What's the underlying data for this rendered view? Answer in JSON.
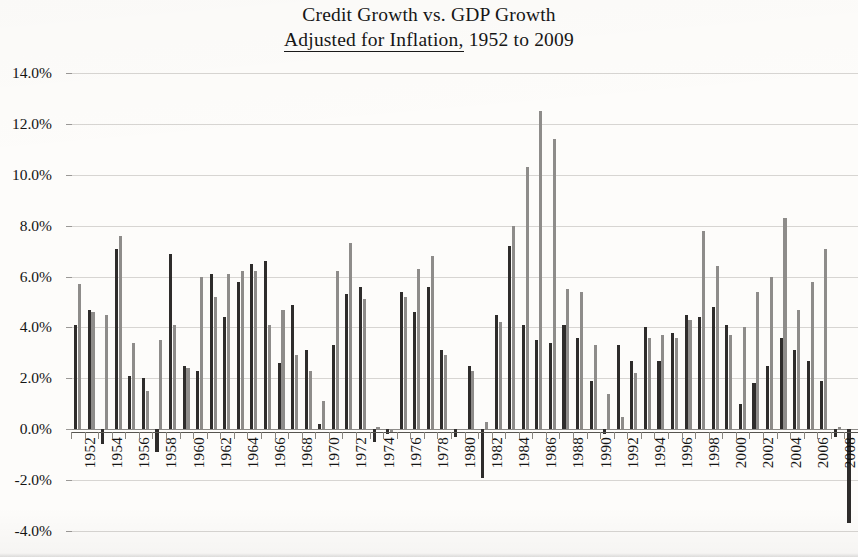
{
  "title": {
    "line1": "Credit Growth vs. GDP Growth",
    "line2_underlined": "Adjusted for Inflation,",
    "line2_rest": " 1952 to 2009"
  },
  "axes": {
    "y_ticks": [
      "14.0%",
      "12.0%",
      "10.0%",
      "8.0%",
      "6.0%",
      "4.0%",
      "2.0%",
      "0.0%",
      "-2.0%",
      "-4.0%"
    ],
    "y_values": [
      14,
      12,
      10,
      8,
      6,
      4,
      2,
      0,
      -2,
      -4
    ],
    "x_ticks": [
      "1952",
      "1954",
      "1956",
      "1958",
      "1960",
      "1962",
      "1964",
      "1966",
      "1968",
      "1970",
      "1972",
      "1974",
      "1976",
      "1978",
      "1980",
      "1982",
      "1984",
      "1986",
      "1988",
      "1990",
      "1992",
      "1994",
      "1996",
      "1998",
      "2000",
      "2002",
      "2004",
      "2006",
      "2008"
    ]
  },
  "colors": {
    "series_gdp": "#2e2c2b",
    "series_credit": "#8e8c8a",
    "gridline": "#d7d5d2",
    "axis": "#56544f",
    "paper": "#fdfcfa"
  },
  "chart_data": {
    "type": "bar",
    "title": "Credit Growth vs. GDP Growth Adjusted for Inflation, 1952 to 2009",
    "xlabel": "",
    "ylabel": "",
    "ylim": [
      -4,
      14
    ],
    "grid": true,
    "legend": "none",
    "categories": [
      1952,
      1953,
      1954,
      1955,
      1956,
      1957,
      1958,
      1959,
      1960,
      1961,
      1962,
      1963,
      1964,
      1965,
      1966,
      1967,
      1968,
      1969,
      1970,
      1971,
      1972,
      1973,
      1974,
      1975,
      1976,
      1977,
      1978,
      1979,
      1980,
      1981,
      1982,
      1983,
      1984,
      1985,
      1986,
      1987,
      1988,
      1989,
      1990,
      1991,
      1992,
      1993,
      1994,
      1995,
      1996,
      1997,
      1998,
      1999,
      2000,
      2001,
      2002,
      2003,
      2004,
      2005,
      2006,
      2007,
      2008,
      2009
    ],
    "series": [
      {
        "name": "GDP Growth",
        "color": "#2e2c2b",
        "values": [
          4.1,
          4.7,
          -0.6,
          7.1,
          2.1,
          2.0,
          -0.9,
          6.9,
          2.5,
          2.3,
          6.1,
          4.4,
          5.8,
          6.5,
          6.6,
          2.6,
          4.9,
          3.1,
          0.2,
          3.3,
          5.3,
          5.6,
          -0.5,
          -0.2,
          5.4,
          4.6,
          5.6,
          3.1,
          -0.3,
          2.5,
          -1.9,
          4.5,
          7.2,
          4.1,
          3.5,
          3.4,
          4.1,
          3.6,
          1.9,
          -0.2,
          3.3,
          2.7,
          4.0,
          2.7,
          3.8,
          4.5,
          4.4,
          4.8,
          4.1,
          1.0,
          1.8,
          2.5,
          3.6,
          3.1,
          2.7,
          1.9,
          -0.3,
          -3.7
        ]
      },
      {
        "name": "Credit Growth",
        "color": "#8e8c8a",
        "values": [
          5.7,
          4.6,
          4.5,
          7.6,
          3.4,
          1.5,
          3.5,
          4.1,
          2.4,
          6.0,
          5.2,
          6.1,
          6.2,
          6.2,
          4.1,
          4.7,
          2.9,
          2.3,
          1.1,
          6.2,
          7.3,
          5.1,
          0.1,
          -0.1,
          5.2,
          6.3,
          6.8,
          2.9,
          0.0,
          2.3,
          0.3,
          4.2,
          8.0,
          10.3,
          12.5,
          11.4,
          5.5,
          5.4,
          3.3,
          1.4,
          0.5,
          2.2,
          3.6,
          3.7,
          3.6,
          4.3,
          7.8,
          6.4,
          3.7,
          4.0,
          5.4,
          6.0,
          8.3,
          4.7,
          5.8,
          7.1,
          0.1,
          0.0
        ]
      }
    ]
  }
}
